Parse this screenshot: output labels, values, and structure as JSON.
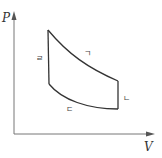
{
  "diagram": {
    "type": "pv-cycle",
    "axes": {
      "y_label": "P",
      "x_label": "V"
    },
    "processes": [
      {
        "id": "giyeok",
        "label": "ㄱ",
        "from": "top-left",
        "to": "right-upper",
        "shape": "expansion-curve"
      },
      {
        "id": "nieun",
        "label": "ㄴ",
        "from": "right-upper",
        "to": "right-lower",
        "shape": "isochoric"
      },
      {
        "id": "digeut",
        "label": "ㄷ",
        "from": "right-lower",
        "to": "left-lower",
        "shape": "compression-curve"
      },
      {
        "id": "rieul",
        "label": "ㄹ",
        "from": "left-lower",
        "to": "top-left",
        "shape": "isochoric"
      }
    ],
    "colors": {
      "axis": "#666666",
      "cycle": "#333333",
      "text": "#444444"
    }
  }
}
